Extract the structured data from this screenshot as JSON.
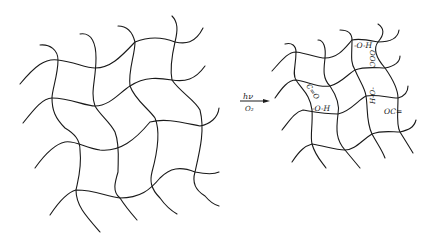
{
  "diagram": {
    "type": "reaction-scheme",
    "left": {
      "name": "polymer-network-before",
      "description": "crosslinked polymer network"
    },
    "arrow": {
      "above": "hν",
      "below": "O₂"
    },
    "right": {
      "name": "polymer-network-after",
      "description": "photo-oxidized polymer network",
      "groups": [
        {
          "id": "g1",
          "label": "-O-H"
        },
        {
          "id": "g2",
          "label": "OOC"
        },
        {
          "id": "g3",
          "label": "C=O"
        },
        {
          "id": "g4",
          "label": "-O-H"
        },
        {
          "id": "g5",
          "label": "H-O-"
        },
        {
          "id": "g6",
          "label": "OC="
        }
      ]
    }
  }
}
